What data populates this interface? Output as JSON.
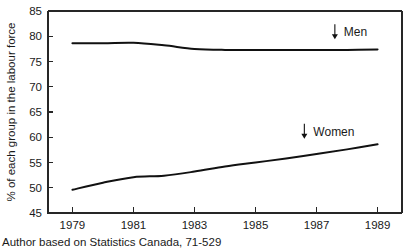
{
  "chart_data": {
    "type": "line",
    "title": "",
    "xlabel": "",
    "ylabel": "% of each group in the labour force",
    "xlim": [
      1978.2,
      1989.8
    ],
    "ylim": [
      45,
      85
    ],
    "grid": false,
    "legend_position": "in-plot-annotations",
    "xticks": [
      "1979",
      "1981",
      "1983",
      "1985",
      "1987",
      "1989"
    ],
    "xtick_values": [
      1979,
      1981,
      1983,
      1985,
      1987,
      1989
    ],
    "yticks": [
      "45",
      "50",
      "55",
      "60",
      "65",
      "70",
      "75",
      "80",
      "85"
    ],
    "ytick_values": [
      45,
      50,
      55,
      60,
      65,
      70,
      75,
      80,
      85
    ],
    "x": [
      1979,
      1980,
      1981,
      1982,
      1983,
      1984,
      1985,
      1986,
      1987,
      1988,
      1989
    ],
    "series": [
      {
        "name": "Men",
        "label": "Men",
        "color": "#111111",
        "values": [
          78.6,
          78.6,
          78.7,
          78.2,
          77.5,
          77.3,
          77.3,
          77.3,
          77.3,
          77.3,
          77.4
        ]
      },
      {
        "name": "Women",
        "label": "Women",
        "color": "#111111",
        "values": [
          49.6,
          51.0,
          52.1,
          52.4,
          53.2,
          54.2,
          55.0,
          55.8,
          56.7,
          57.6,
          58.6
        ]
      }
    ],
    "annotations": [
      {
        "name": "men",
        "arrow_glyph": "down-arrow",
        "label": "Men",
        "x": 1987.6,
        "y": 80.8
      },
      {
        "name": "women",
        "arrow_glyph": "down-arrow",
        "label": "Women",
        "x": 1986.6,
        "y": 61.1
      }
    ],
    "source_note": "Author based on Statistics Canada, 71-529"
  }
}
